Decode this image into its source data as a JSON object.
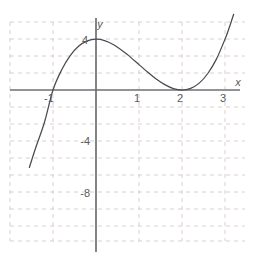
{
  "chart_data": {
    "type": "line",
    "title": "",
    "xlabel": "x",
    "ylabel": "y",
    "xlim": [
      -1.98,
      3.55
    ],
    "ylim": [
      -10.5,
      5.6
    ],
    "grid": true,
    "grid_x_step": 1,
    "grid_y_step": 2,
    "legend": "none",
    "function": "y = (x + 1)(x - 2)^2",
    "roots": [
      -1,
      2
    ],
    "xticks": [
      -1,
      1,
      2,
      3
    ],
    "xtick_labels": [
      "-1",
      "1",
      "2",
      "3"
    ],
    "yticks": [
      4,
      -4,
      -8
    ],
    "ytick_labels": [
      "4",
      "-4",
      "-8"
    ],
    "x": [
      -1.55,
      -1.45,
      -1.35,
      -1.25,
      -1.15,
      -1.05,
      -0.95,
      -0.85,
      -0.75,
      -0.65,
      -0.55,
      -0.45,
      -0.35,
      -0.25,
      -0.15,
      -0.05,
      0.05,
      0.15,
      0.25,
      0.35,
      0.45,
      0.55,
      0.65,
      0.75,
      0.85,
      0.95,
      1.05,
      1.15,
      1.25,
      1.35,
      1.45,
      1.55,
      1.65,
      1.75,
      1.85,
      1.95,
      2.05,
      2.15,
      2.25,
      2.35,
      2.45,
      2.55,
      2.65,
      2.75,
      2.85,
      2.95,
      3.05,
      3.15,
      3.25,
      3.35,
      3.45
    ],
    "y": [
      -7.29,
      -6.35,
      -5.47,
      -4.64,
      -3.86,
      -3.13,
      -2.44,
      -1.8,
      -1.2,
      -0.65,
      -0.14,
      0.34,
      0.77,
      1.16,
      1.52,
      1.84,
      2.12,
      2.37,
      2.59,
      2.77,
      2.92,
      3.04,
      3.13,
      3.19,
      3.22,
      3.23,
      3.21,
      3.17,
      3.09,
      3.0,
      2.87,
      2.73,
      2.55,
      2.36,
      2.13,
      1.88,
      1.6,
      1.29,
      0.95,
      0.57,
      0.16,
      -0.29,
      0.0,
      0.0,
      0.0,
      0.0,
      0.0,
      0.0,
      0.0,
      0.0,
      0.0
    ],
    "series": [
      {
        "name": "cubic",
        "expression": "(x + 1)(x - 2)^2",
        "color": "#4a4a52",
        "points": [
          [
            -1.55,
            -6.1
          ],
          [
            -1.4,
            -4.53
          ],
          [
            -1.2,
            -2.56
          ],
          [
            -1.0,
            0.0
          ],
          [
            -0.8,
            1.57
          ],
          [
            -0.6,
            2.7
          ],
          [
            -0.4,
            3.46
          ],
          [
            -0.2,
            3.87
          ],
          [
            0.0,
            4.0
          ],
          [
            0.2,
            3.89
          ],
          [
            0.4,
            3.58
          ],
          [
            0.667,
            2.96
          ],
          [
            0.8,
            2.59
          ],
          [
            1.0,
            2.0
          ],
          [
            1.2,
            1.41
          ],
          [
            1.4,
            0.86
          ],
          [
            1.6,
            0.42
          ],
          [
            1.8,
            0.11
          ],
          [
            2.0,
            0.0
          ],
          [
            2.2,
            0.13
          ],
          [
            2.4,
            0.54
          ],
          [
            2.6,
            1.3
          ],
          [
            2.8,
            2.43
          ],
          [
            3.0,
            4.0
          ],
          [
            3.1,
            4.92
          ],
          [
            3.2,
            5.95
          ]
        ]
      }
    ],
    "annotations": [],
    "key_features": {
      "local_max_x": 0.0,
      "local_max_y": 4.0,
      "local_min_x": 2.0,
      "local_min_y": 0.0,
      "x_intercepts": [
        "-1",
        "2"
      ],
      "y_intercept": 4
    }
  },
  "axes": {
    "x_axis_label": "x",
    "y_axis_label": "y"
  },
  "ticks": {
    "x": [
      {
        "label": "-1",
        "value": -1
      },
      {
        "label": "1",
        "value": 1
      },
      {
        "label": "2",
        "value": 2
      },
      {
        "label": "3",
        "value": 3
      }
    ],
    "y": [
      {
        "label": "4",
        "value": 4
      },
      {
        "label": "-4",
        "value": -4
      },
      {
        "label": "-8",
        "value": -8
      }
    ]
  },
  "colors": {
    "background": "#ffffff",
    "grid": "#d8c8cc",
    "axis": "#6f6f74",
    "curve": "#4a4a52",
    "text": "#5a5a60"
  }
}
